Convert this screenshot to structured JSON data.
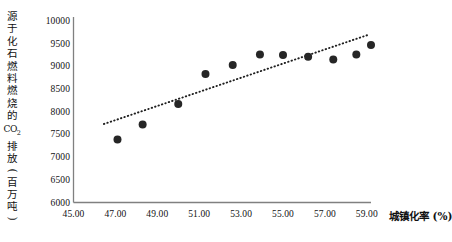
{
  "chart_data": {
    "type": "scatter",
    "title": "",
    "ylabel": "源于化石燃料燃烧的CO₂排放(百万吨)",
    "ylabel_chars": [
      "源",
      "于",
      "化",
      "石",
      "燃",
      "料",
      "燃",
      "烧",
      "的",
      "CO",
      "排",
      "放",
      "(",
      "百",
      "万",
      "吨",
      ")"
    ],
    "xlabel": "城镇化率 (%)",
    "xlabel_main": "城镇化率",
    "xlabel_unit": "(%)",
    "xlim": [
      45.0,
      59.9
    ],
    "ylim": [
      6000,
      10000
    ],
    "xticks": [
      "45.00",
      "47.00",
      "49.00",
      "51.00",
      "53.00",
      "55.00",
      "57.00",
      "59.00"
    ],
    "xtick_values": [
      45.0,
      47.0,
      49.0,
      51.0,
      53.0,
      55.0,
      57.0,
      59.0
    ],
    "yticks": [
      "6000",
      "6500",
      "7000",
      "7500",
      "8000",
      "8500",
      "9000",
      "9500",
      "10000"
    ],
    "ytick_values": [
      6000,
      6500,
      7000,
      7500,
      8000,
      8500,
      9000,
      9500,
      10000
    ],
    "grid": false,
    "legend": "none",
    "marker_color": "#262626",
    "marker_shape": "circle",
    "marker_size_px": 8,
    "axis_color": "#808080",
    "points": [
      {
        "x": 47.1,
        "y": 7390
      },
      {
        "x": 48.3,
        "y": 7720
      },
      {
        "x": 50.0,
        "y": 8170
      },
      {
        "x": 51.3,
        "y": 8830
      },
      {
        "x": 52.6,
        "y": 9030
      },
      {
        "x": 53.9,
        "y": 9260
      },
      {
        "x": 55.0,
        "y": 9250
      },
      {
        "x": 56.2,
        "y": 9210
      },
      {
        "x": 57.4,
        "y": 9150
      },
      {
        "x": 58.5,
        "y": 9260
      },
      {
        "x": 59.2,
        "y": 9470
      }
    ],
    "series": [
      {
        "name": "源于化石燃料燃烧的CO₂排放",
        "x": [
          47.1,
          48.3,
          50.0,
          51.3,
          52.6,
          53.9,
          55.0,
          56.2,
          57.4,
          58.5,
          59.2
        ],
        "values": [
          7390,
          7720,
          8170,
          8830,
          9030,
          9260,
          9250,
          9210,
          9150,
          9260,
          9470
        ]
      }
    ],
    "trendline": {
      "style": "dotted",
      "color": "#1f1f1f",
      "x_start": 46.45,
      "y_start": 7730,
      "x_end": 59.1,
      "y_end": 9700
    }
  }
}
